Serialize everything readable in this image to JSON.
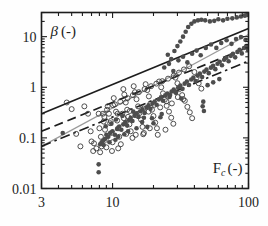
{
  "figure": {
    "background": "#fefefe",
    "frame_color": "#1d1d1d"
  },
  "chart_data": {
    "type": "scatter",
    "title": "",
    "xlabel": "F_c (-)",
    "ylabel": "β (-)",
    "xlabel_parts": {
      "base": "F",
      "sub": "c",
      "unit": "(-)"
    },
    "ylabel_parts": {
      "base": "β",
      "unit": "(-)"
    },
    "xscale": "log",
    "yscale": "log",
    "xlim": [
      3,
      100
    ],
    "ylim": [
      0.01,
      30
    ],
    "xticks": [
      3,
      10,
      100
    ],
    "xticklabels": [
      "3",
      "10",
      "100"
    ],
    "yticks": [
      0.01,
      0.1,
      1,
      10
    ],
    "yticklabels": [
      "0.01",
      "0.1",
      "1",
      "10"
    ],
    "grid": false,
    "legend": "none",
    "minor_ticks": true,
    "series": [
      {
        "name": "open-circles",
        "marker": "open-circle",
        "color": "#3c3c3c",
        "fill": "none",
        "points": [
          [
            6.2,
            0.42
          ],
          [
            6.6,
            0.3
          ],
          [
            6.9,
            0.135
          ],
          [
            7.0,
            0.085
          ],
          [
            7.3,
            0.078
          ],
          [
            7.6,
            0.062
          ],
          [
            7.9,
            0.3
          ],
          [
            8.0,
            0.155
          ],
          [
            8.2,
            0.105
          ],
          [
            8.3,
            0.068
          ],
          [
            8.5,
            0.3
          ],
          [
            8.6,
            0.21
          ],
          [
            8.8,
            0.145
          ],
          [
            8.9,
            0.092
          ],
          [
            9.0,
            0.065
          ],
          [
            9.2,
            0.42
          ],
          [
            9.4,
            0.3
          ],
          [
            9.6,
            0.195
          ],
          [
            9.8,
            0.125
          ],
          [
            10.0,
            0.082
          ],
          [
            10.2,
            0.61
          ],
          [
            10.4,
            0.46
          ],
          [
            10.6,
            0.33
          ],
          [
            10.8,
            0.22
          ],
          [
            11.0,
            0.155
          ],
          [
            11.2,
            0.105
          ],
          [
            11.5,
            0.075
          ],
          [
            11.8,
            0.3
          ],
          [
            12.0,
            0.92
          ],
          [
            12.2,
            0.72
          ],
          [
            12.5,
            0.5
          ],
          [
            12.8,
            0.36
          ],
          [
            13.0,
            0.26
          ],
          [
            13.3,
            0.185
          ],
          [
            13.6,
            0.135
          ],
          [
            14.0,
            0.1
          ],
          [
            14.3,
            1.05
          ],
          [
            14.6,
            0.8
          ],
          [
            15.0,
            0.58
          ],
          [
            15.4,
            0.42
          ],
          [
            15.8,
            0.31
          ],
          [
            16.2,
            0.23
          ],
          [
            16.6,
            0.165
          ],
          [
            17.0,
            0.125
          ],
          [
            17.5,
            1.15
          ],
          [
            18.0,
            0.88
          ],
          [
            18.5,
            0.66
          ],
          [
            19.0,
            0.48
          ],
          [
            19.5,
            0.36
          ],
          [
            20.0,
            0.27
          ],
          [
            20.6,
            0.2
          ],
          [
            21.2,
            0.155
          ],
          [
            22.0,
            1.3
          ],
          [
            22.8,
            1.0
          ],
          [
            23.5,
            0.76
          ],
          [
            24.2,
            0.57
          ],
          [
            25.0,
            0.43
          ],
          [
            26.0,
            0.33
          ],
          [
            27.0,
            0.25
          ],
          [
            28.0,
            0.19
          ],
          [
            29.0,
            1.55
          ],
          [
            30.0,
            1.2
          ],
          [
            31.0,
            0.92
          ],
          [
            32.5,
            0.7
          ],
          [
            34.0,
            0.54
          ],
          [
            35.5,
            0.41
          ],
          [
            37.0,
            0.32
          ],
          [
            38.5,
            0.245
          ],
          [
            40.0,
            2.0
          ],
          [
            41.5,
            1.55
          ],
          [
            43.0,
            1.2
          ],
          [
            45.0,
            0.94
          ],
          [
            4.6,
            0.5
          ],
          [
            5.0,
            0.37
          ],
          [
            5.4,
            0.12
          ],
          [
            5.8,
            0.068
          ],
          [
            7.2,
            0.055
          ],
          [
            8.1,
            0.052
          ],
          [
            9.9,
            0.055
          ],
          [
            11.0,
            0.062
          ],
          [
            12.6,
            0.12
          ],
          [
            14.8,
            0.115
          ],
          [
            16.8,
            0.118
          ],
          [
            18.8,
            0.155
          ],
          [
            21.5,
            0.115
          ],
          [
            24.5,
            0.145
          ],
          [
            9.1,
            0.36
          ],
          [
            10.1,
            0.44
          ],
          [
            11.4,
            0.52
          ],
          [
            12.9,
            0.61
          ],
          [
            14.1,
            0.7
          ],
          [
            15.6,
            0.8
          ],
          [
            17.2,
            0.92
          ],
          [
            19.2,
            1.05
          ],
          [
            21.0,
            1.18
          ],
          [
            23.2,
            1.32
          ],
          [
            25.6,
            1.48
          ],
          [
            28.2,
            1.7
          ],
          [
            30.8,
            1.95
          ],
          [
            33.5,
            2.25
          ],
          [
            36.6,
            2.6
          ],
          [
            8.7,
            0.26
          ],
          [
            9.7,
            0.215
          ],
          [
            10.9,
            0.3
          ],
          [
            12.1,
            0.245
          ],
          [
            13.4,
            0.34
          ],
          [
            15.1,
            0.28
          ],
          [
            16.9,
            0.38
          ],
          [
            18.4,
            0.33
          ],
          [
            20.3,
            0.45
          ],
          [
            22.4,
            0.4
          ],
          [
            24.9,
            0.53
          ],
          [
            27.3,
            0.48
          ],
          [
            30.2,
            0.64
          ],
          [
            33.1,
            0.58
          ]
        ]
      },
      {
        "name": "filled-circles",
        "marker": "filled-circle",
        "color": "#4d4d4d",
        "fill": "#4d4d4d",
        "points": [
          [
            7.9,
            0.021
          ],
          [
            7.9,
            0.03
          ],
          [
            8.1,
            0.075
          ],
          [
            8.3,
            0.082
          ],
          [
            8.5,
            0.088
          ],
          [
            8.6,
            0.072
          ],
          [
            8.8,
            0.095
          ],
          [
            9.0,
            0.115
          ],
          [
            9.3,
            0.105
          ],
          [
            9.6,
            0.125
          ],
          [
            10.0,
            0.135
          ],
          [
            10.4,
            0.115
          ],
          [
            10.8,
            0.15
          ],
          [
            11.2,
            0.168
          ],
          [
            11.6,
            0.145
          ],
          [
            12.0,
            0.185
          ],
          [
            12.4,
            0.205
          ],
          [
            12.8,
            0.175
          ],
          [
            13.2,
            0.225
          ],
          [
            13.6,
            0.25
          ],
          [
            14.0,
            0.215
          ],
          [
            14.5,
            0.275
          ],
          [
            15.0,
            0.305
          ],
          [
            15.5,
            0.26
          ],
          [
            16.0,
            0.335
          ],
          [
            16.6,
            0.365
          ],
          [
            17.2,
            0.31
          ],
          [
            17.8,
            0.4
          ],
          [
            18.4,
            0.44
          ],
          [
            19.0,
            0.375
          ],
          [
            19.7,
            0.48
          ],
          [
            20.4,
            0.525
          ],
          [
            21.1,
            0.45
          ],
          [
            21.9,
            0.575
          ],
          [
            22.7,
            0.63
          ],
          [
            23.5,
            0.54
          ],
          [
            24.4,
            0.69
          ],
          [
            25.3,
            0.755
          ],
          [
            26.2,
            0.645
          ],
          [
            27.2,
            0.825
          ],
          [
            28.2,
            0.905
          ],
          [
            29.3,
            0.775
          ],
          [
            30.4,
            0.99
          ],
          [
            31.5,
            1.08
          ],
          [
            32.7,
            0.93
          ],
          [
            33.9,
            1.18
          ],
          [
            35.2,
            1.3
          ],
          [
            36.5,
            1.11
          ],
          [
            37.9,
            1.42
          ],
          [
            39.3,
            1.55
          ],
          [
            40.8,
            1.33
          ],
          [
            42.3,
            1.7
          ],
          [
            43.9,
            1.86
          ],
          [
            45.6,
            1.59
          ],
          [
            47.3,
            2.04
          ],
          [
            49.1,
            2.23
          ],
          [
            51.0,
            1.9
          ],
          [
            52.9,
            2.44
          ],
          [
            54.9,
            2.67
          ],
          [
            57.0,
            2.28
          ],
          [
            59.2,
            2.92
          ],
          [
            61.4,
            3.19
          ],
          [
            63.8,
            2.73
          ],
          [
            66.2,
            3.49
          ],
          [
            68.7,
            3.82
          ],
          [
            71.4,
            3.26
          ],
          [
            74.1,
            4.18
          ],
          [
            76.9,
            4.57
          ],
          [
            79.8,
            3.9
          ],
          [
            82.9,
            5.0
          ],
          [
            86.0,
            5.47
          ],
          [
            89.3,
            4.67
          ],
          [
            92.7,
            5.98
          ],
          [
            96.2,
            6.54
          ],
          [
            99.0,
            5.6
          ],
          [
            25.5,
            4.4
          ],
          [
            27.0,
            3.6
          ],
          [
            28.5,
            5.2
          ],
          [
            30.0,
            6.5
          ],
          [
            31.5,
            8.0
          ],
          [
            33.0,
            10.0
          ],
          [
            34.5,
            12.5
          ],
          [
            36.0,
            15.5
          ],
          [
            38.0,
            18.0
          ],
          [
            40.0,
            20.0
          ],
          [
            42.5,
            21.0
          ],
          [
            45.0,
            21.5
          ],
          [
            48.0,
            21.0
          ],
          [
            52.0,
            20.0
          ],
          [
            56.0,
            20.5
          ],
          [
            60.0,
            22.0
          ],
          [
            65.0,
            21.0
          ],
          [
            70.0,
            22.5
          ],
          [
            76.0,
            23.0
          ],
          [
            82.0,
            24.0
          ],
          [
            88.0,
            25.0
          ],
          [
            94.0,
            26.0
          ],
          [
            98.0,
            27.0
          ],
          [
            24.0,
            2.45
          ],
          [
            26.0,
            2.9
          ],
          [
            28.0,
            2.1
          ],
          [
            30.5,
            3.4
          ],
          [
            33.0,
            4.0
          ],
          [
            35.5,
            3.1
          ],
          [
            38.5,
            4.6
          ],
          [
            41.5,
            5.3
          ],
          [
            44.5,
            4.3
          ],
          [
            48.5,
            6.0
          ],
          [
            53.0,
            7.0
          ],
          [
            58.0,
            6.0
          ],
          [
            63.0,
            7.5
          ],
          [
            69.0,
            8.5
          ],
          [
            75.0,
            7.2
          ],
          [
            81.0,
            9.0
          ],
          [
            88.0,
            9.8
          ],
          [
            95.0,
            8.6
          ],
          [
            46.0,
            0.42
          ],
          [
            46.5,
            0.52
          ],
          [
            47.0,
            0.34
          ],
          [
            50.0,
            1.1
          ],
          [
            55.0,
            1.25
          ],
          [
            61.0,
            1.45
          ],
          [
            18.0,
            0.165
          ],
          [
            20.0,
            0.195
          ],
          [
            22.5,
            0.255
          ],
          [
            13.0,
            0.135
          ],
          [
            15.0,
            0.155
          ],
          [
            11.0,
            0.105
          ],
          [
            9.5,
            0.082
          ],
          [
            10.5,
            0.092
          ],
          [
            12.2,
            0.118
          ],
          [
            16.5,
            0.205
          ],
          [
            19.5,
            0.245
          ],
          [
            23.0,
            0.295
          ],
          [
            8.9,
            0.17
          ],
          [
            9.8,
            0.19
          ],
          [
            10.6,
            0.23
          ],
          [
            11.8,
            0.27
          ],
          [
            14.2,
            0.33
          ],
          [
            17.0,
            0.25
          ],
          [
            26.5,
            0.7
          ],
          [
            29.0,
            0.8
          ],
          [
            32.0,
            0.6
          ],
          [
            4.3,
            0.125
          ]
        ]
      }
    ],
    "lines": [
      {
        "name": "solid-black-upper",
        "style": "solid",
        "color": "#1d1d1d",
        "width": 1.7,
        "from": [
          3,
          0.3
        ],
        "to": [
          100,
          14.5
        ]
      },
      {
        "name": "solid-gray",
        "style": "solid",
        "color": "#9a9a9a",
        "width": 1.2,
        "from": [
          3,
          0.068
        ],
        "to": [
          100,
          11.0
        ]
      },
      {
        "name": "long-dashed",
        "style": "dashed",
        "color": "#1d1d1d",
        "width": 1.7,
        "from": [
          3,
          0.135
        ],
        "to": [
          100,
          6.2
        ]
      },
      {
        "name": "dash-dot",
        "style": "dashdot",
        "color": "#1d1d1d",
        "width": 1.7,
        "from": [
          3,
          0.068
        ],
        "to": [
          100,
          3.3
        ]
      }
    ]
  }
}
